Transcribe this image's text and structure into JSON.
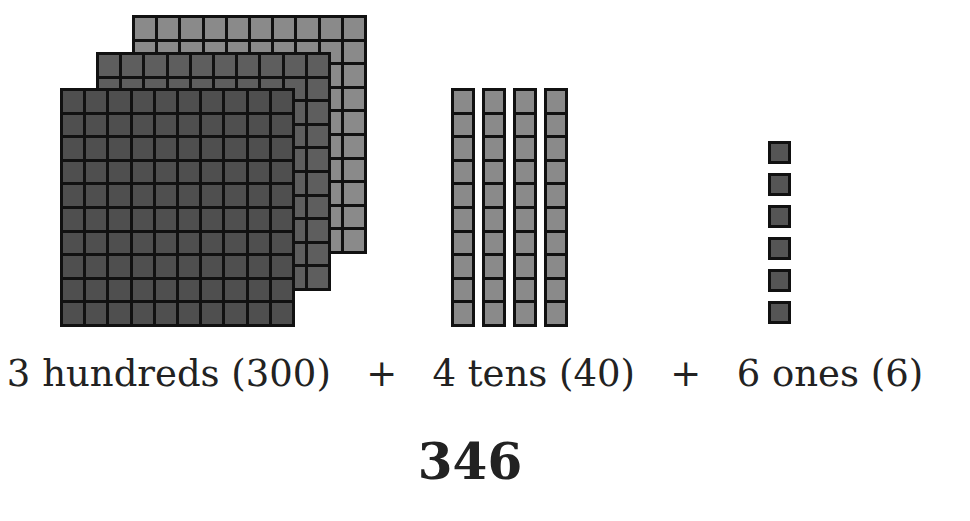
{
  "blocks": {
    "hundreds": {
      "count": 3,
      "color_back": "#8a8a8a",
      "color_middle": "#5e5e5e",
      "color_front": "#4f4f4f"
    },
    "tens": {
      "count": 4,
      "color": "#8a8a8a"
    },
    "ones": {
      "count": 6,
      "color": "#555555"
    }
  },
  "caption": {
    "hundreds": "3 hundreds (300)",
    "plus1": "+",
    "tens": "4 tens (40)",
    "plus2": "+",
    "ones": "6 ones (6)"
  },
  "total": "346"
}
